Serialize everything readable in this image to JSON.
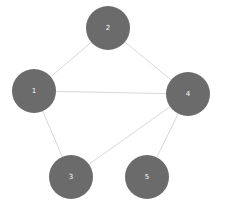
{
  "diagram": {
    "type": "node-link-graph",
    "canvas": {
      "width": 225,
      "height": 211,
      "background": "#ffffff"
    },
    "style": {
      "node_fill": "#6b6b6b",
      "node_radius": 22,
      "node_label_color": "#ffffff",
      "node_label_size": 7,
      "edge_color": "#d9d9d9",
      "edge_width": 1
    },
    "nodes": [
      {
        "id": "1",
        "label": "1",
        "cx": 34,
        "cy": 91,
        "r": 22
      },
      {
        "id": "2",
        "label": "2",
        "cx": 108,
        "cy": 28,
        "r": 22
      },
      {
        "id": "3",
        "label": "3",
        "cx": 71,
        "cy": 177,
        "r": 22
      },
      {
        "id": "4",
        "label": "4",
        "cx": 188,
        "cy": 94,
        "r": 22
      },
      {
        "id": "5",
        "label": "5",
        "cx": 147,
        "cy": 177,
        "r": 22
      }
    ],
    "edges": [
      {
        "source": "1",
        "target": "2"
      },
      {
        "source": "2",
        "target": "4"
      },
      {
        "source": "1",
        "target": "4"
      },
      {
        "source": "1",
        "target": "3"
      },
      {
        "source": "3",
        "target": "4"
      },
      {
        "source": "4",
        "target": "5"
      }
    ]
  }
}
